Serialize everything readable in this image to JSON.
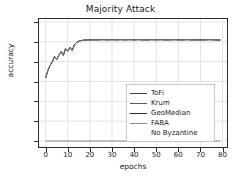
{
  "chart_data": {
    "type": "line",
    "title": "Majority Attack",
    "xlabel": "epochs",
    "ylabel": "accuracy",
    "xlim": [
      -3,
      82
    ],
    "ylim": [
      0.07,
      0.715
    ],
    "grid": true,
    "legend_position": "center-right",
    "xticks": [
      0,
      10,
      20,
      30,
      40,
      50,
      60,
      70,
      80
    ],
    "xtick_labels": [
      "0",
      "10",
      "20",
      "30",
      "40",
      "50",
      "60",
      "70",
      "80"
    ],
    "yticks": [
      0.1,
      0.2,
      0.3,
      0.4,
      0.5,
      0.6,
      0.7
    ],
    "ytick_labels": [
      "0.1",
      "0.2",
      "0.3",
      "0.4",
      "0.5",
      "0.6",
      "0.7"
    ],
    "x": [
      0,
      1,
      2,
      3,
      4,
      5,
      6,
      7,
      8,
      9,
      10,
      11,
      12,
      13,
      14,
      15,
      16,
      17,
      18,
      19,
      20,
      22,
      24,
      26,
      28,
      30,
      32,
      34,
      36,
      38,
      40,
      42,
      44,
      46,
      48,
      50,
      52,
      54,
      56,
      58,
      60,
      62,
      64,
      66,
      68,
      70,
      72,
      74,
      76,
      78,
      79
    ],
    "series": [
      {
        "name": "ToFi",
        "color": "#3a3a3a",
        "values": [
          0.418,
          0.455,
          0.482,
          0.498,
          0.527,
          0.512,
          0.534,
          0.551,
          0.532,
          0.566,
          0.553,
          0.572,
          0.556,
          0.585,
          0.597,
          0.603,
          0.606,
          0.608,
          0.609,
          0.61,
          0.61,
          0.61,
          0.61,
          0.611,
          0.61,
          0.611,
          0.61,
          0.611,
          0.61,
          0.611,
          0.61,
          0.611,
          0.61,
          0.61,
          0.611,
          0.61,
          0.611,
          0.61,
          0.61,
          0.611,
          0.61,
          0.61,
          0.611,
          0.61,
          0.61,
          0.61,
          0.61,
          0.611,
          0.61,
          0.609,
          0.609
        ]
      },
      {
        "name": "Krum",
        "color": "#5a5a5a",
        "values": [
          0.418,
          0.455,
          0.482,
          0.498,
          0.527,
          0.512,
          0.534,
          0.551,
          0.532,
          0.566,
          0.553,
          0.572,
          0.556,
          0.585,
          0.597,
          0.603,
          0.606,
          0.608,
          0.609,
          0.61,
          0.61,
          0.61,
          0.61,
          0.611,
          0.61,
          0.611,
          0.61,
          0.611,
          0.61,
          0.611,
          0.61,
          0.611,
          0.61,
          0.61,
          0.611,
          0.61,
          0.611,
          0.61,
          0.61,
          0.611,
          0.61,
          0.61,
          0.611,
          0.61,
          0.61,
          0.61,
          0.61,
          0.611,
          0.61,
          0.609,
          0.609
        ]
      },
      {
        "name": "GeoMedian",
        "color": "#2b2b2b",
        "values": [
          0.418,
          0.455,
          0.482,
          0.498,
          0.527,
          0.512,
          0.534,
          0.551,
          0.532,
          0.566,
          0.553,
          0.572,
          0.556,
          0.585,
          0.597,
          0.603,
          0.606,
          0.608,
          0.609,
          0.61,
          0.61,
          0.61,
          0.61,
          0.611,
          0.61,
          0.611,
          0.61,
          0.611,
          0.61,
          0.611,
          0.61,
          0.611,
          0.61,
          0.61,
          0.611,
          0.61,
          0.611,
          0.61,
          0.61,
          0.611,
          0.61,
          0.61,
          0.611,
          0.61,
          0.61,
          0.61,
          0.61,
          0.611,
          0.61,
          0.609,
          0.609
        ]
      },
      {
        "name": "FABA",
        "color": "#8a8a8a",
        "values": [
          0.418,
          0.455,
          0.482,
          0.498,
          0.527,
          0.512,
          0.534,
          0.551,
          0.532,
          0.566,
          0.553,
          0.572,
          0.556,
          0.585,
          0.597,
          0.603,
          0.606,
          0.608,
          0.609,
          0.61,
          0.61,
          0.61,
          0.61,
          0.611,
          0.61,
          0.611,
          0.61,
          0.611,
          0.61,
          0.611,
          0.61,
          0.611,
          0.61,
          0.61,
          0.611,
          0.61,
          0.611,
          0.61,
          0.61,
          0.611,
          0.61,
          0.61,
          0.611,
          0.61,
          0.61,
          0.61,
          0.61,
          0.611,
          0.61,
          0.609,
          0.609
        ]
      },
      {
        "name": "No Byzantine",
        "color": "#6e6e6e",
        "values": [
          0.1,
          0.1,
          0.1,
          0.1,
          0.1,
          0.1,
          0.1,
          0.1,
          0.1,
          0.1,
          0.1,
          0.1,
          0.1,
          0.1,
          0.1,
          0.1,
          0.1,
          0.1,
          0.1,
          0.1,
          0.1,
          0.1,
          0.1,
          0.1,
          0.1,
          0.1,
          0.1,
          0.1,
          0.1,
          0.1,
          0.1,
          0.1,
          0.1,
          0.1,
          0.1,
          0.1,
          0.1,
          0.1,
          0.1,
          0.1,
          0.1,
          0.1,
          0.1,
          0.1,
          0.1,
          0.1,
          0.1,
          0.1,
          0.1,
          0.1,
          0.1
        ]
      }
    ]
  },
  "legend": {
    "entries": [
      {
        "label": "ToFi"
      },
      {
        "label": "Krum"
      },
      {
        "label": "GeoMedian"
      },
      {
        "label": "FABA"
      },
      {
        "label": "No Byzantine"
      }
    ]
  },
  "colors": {
    "axis": "#2b2b2b",
    "grid": "#e3e3e3",
    "text": "#1a1a1a",
    "background": "#ffffff",
    "legend_border": "#c8c8c8"
  }
}
